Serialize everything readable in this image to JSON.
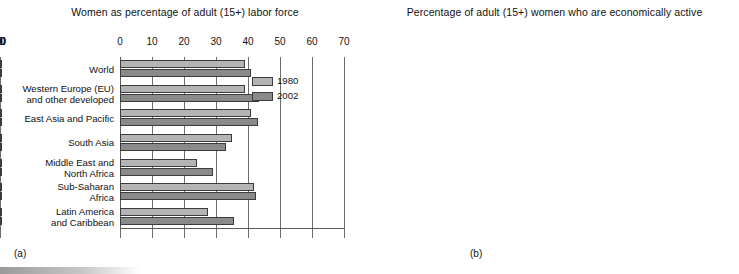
{
  "figure": {
    "panel_a_caption": "(a)",
    "panel_b_caption": "(b)"
  },
  "legend": {
    "items": [
      {
        "label": "1980",
        "color": "#b4b4b4"
      },
      {
        "label": "2002",
        "color": "#8a8a8a"
      }
    ]
  },
  "chart_data": [
    {
      "type": "bar",
      "orientation": "horizontal",
      "panel": "(a)",
      "title": "Women as percentage of adult (15+) labor force",
      "xlabel": "",
      "ylabel": "",
      "xlim": [
        0,
        70
      ],
      "xticks": [
        0,
        10,
        20,
        30,
        40,
        50,
        60,
        70
      ],
      "xticklabels": [
        "0",
        "10",
        "20",
        "30",
        "40",
        "50",
        "60",
        "70"
      ],
      "grid": true,
      "legend_position": "inside-right",
      "categories": [
        "World",
        "Western Europe (EU)\nand other developed",
        "East Asia and Pacific",
        "South Asia",
        "Middle East and\nNorth Africa",
        "Sub-Saharan\nAfrica",
        "Latin America\nand Caribbean"
      ],
      "series": [
        {
          "name": "1980",
          "values": [
            39,
            39,
            41,
            35,
            24,
            42,
            27.5
          ]
        },
        {
          "name": "2002",
          "values": [
            41,
            43.5,
            43,
            33,
            29,
            42.5,
            35.5
          ]
        }
      ]
    },
    {
      "type": "bar",
      "orientation": "horizontal",
      "panel": "(b)",
      "title": "Percentage of adult (15+) women\nwho are economically active",
      "xlabel": "",
      "ylabel": "",
      "xlim": [
        0,
        80
      ],
      "xticks": [
        0,
        10,
        20,
        30,
        40,
        50,
        60,
        70,
        80
      ],
      "xticklabels": [
        "0",
        "10",
        "20",
        "30",
        "40",
        "50",
        "60",
        "70",
        "80"
      ],
      "grid": true,
      "legend_position": "none",
      "categories": [
        "World",
        "Western Europe (EU)\nand other developed",
        "East Asia and Pacific",
        "South Asia",
        "Middle East and\nNorth Africa",
        "Sub-Saharan\nAfrica",
        "Latin America\nand Caribbean"
      ],
      "series": [
        {
          "name": "1980",
          "values": [
            56.5,
            52,
            70,
            47,
            24,
            59,
            33
          ]
        },
        {
          "name": "2002",
          "values": [
            60,
            63,
            74.5,
            46,
            32.5,
            61,
            43
          ]
        }
      ]
    }
  ]
}
